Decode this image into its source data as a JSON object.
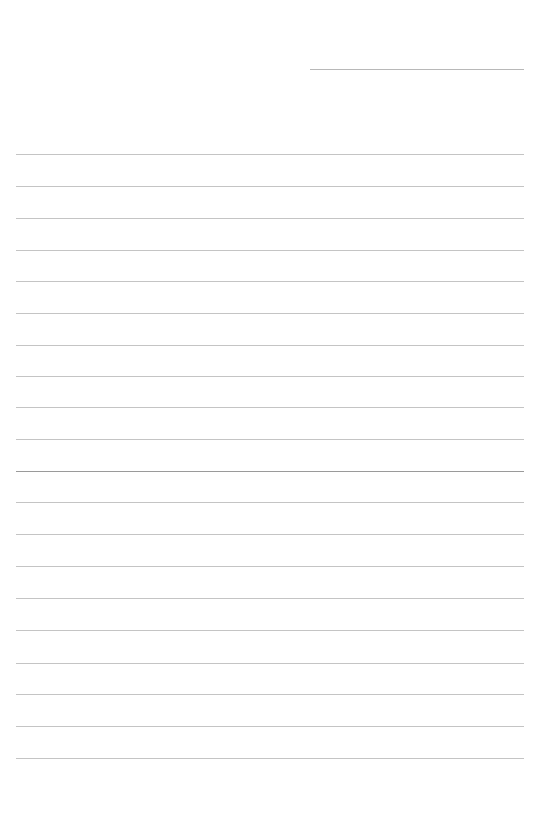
{
  "sheet": {
    "background": "#ffffff",
    "header_line": {
      "x1": 310,
      "x2": 524,
      "y": 69,
      "color": "#b8b8b8"
    },
    "rules": {
      "x1": 16,
      "x2": 524,
      "color": "#c4c4c4",
      "y_positions": [
        154,
        186,
        218,
        250,
        281,
        313,
        345,
        376,
        407,
        439,
        471,
        502,
        534,
        566,
        598,
        630,
        663,
        694,
        726,
        758
      ],
      "emphasized_index": 10,
      "emphasized_color": "#9a9a9a"
    }
  }
}
